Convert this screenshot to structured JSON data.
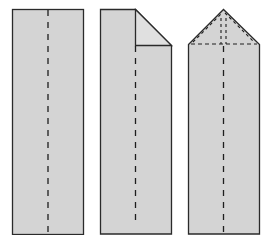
{
  "diagram": {
    "steps": [
      {
        "id": 1,
        "name": "flat-strip-with-center-crease"
      },
      {
        "id": 2,
        "name": "corner-folded-down"
      },
      {
        "id": 3,
        "name": "pointed-top-with-folded-corners"
      }
    ],
    "colors": {
      "paper": "#d4d4d4",
      "flap": "#dedede",
      "outline": "#2a2a2a",
      "crease": "#1e1e1e"
    }
  }
}
